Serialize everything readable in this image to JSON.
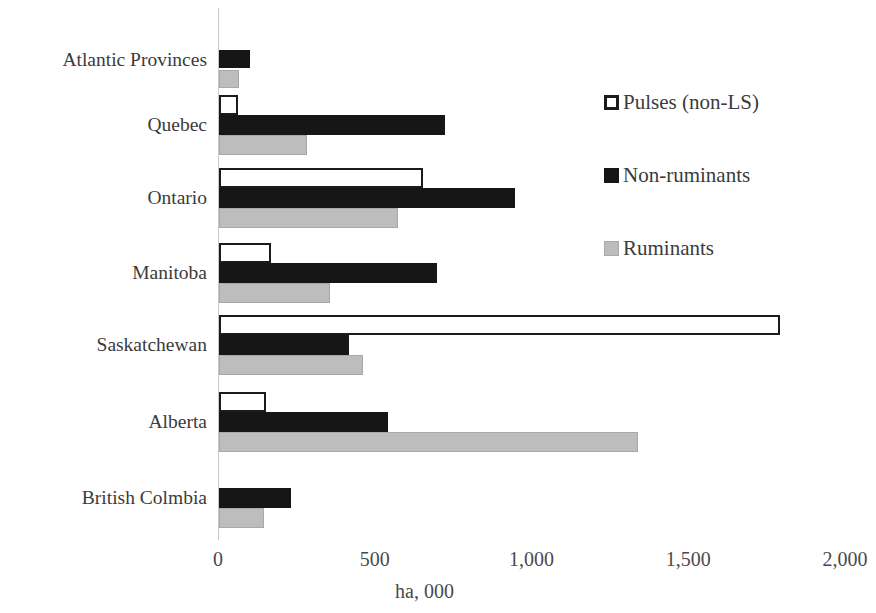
{
  "chart_data": {
    "type": "bar",
    "orientation": "horizontal",
    "title": "",
    "xlabel": "ha, 000",
    "ylabel": "",
    "xlim": [
      0,
      2000
    ],
    "xticks": [
      0,
      500,
      1000,
      1500,
      2000
    ],
    "xtick_labels": [
      "0",
      "500",
      "1,000",
      "1,500",
      "2,000"
    ],
    "grid": false,
    "legend_position": "right-top",
    "categories": [
      "Atlantic Provinces",
      "Quebec",
      "Ontario",
      "Manitoba",
      "Saskatchewan",
      "Alberta",
      "British Colmbia"
    ],
    "series": [
      {
        "name": "Pulses (non-LS)",
        "color": "#ffffff",
        "edge_color": "#1b1b1b",
        "values": [
          0,
          60,
          650,
          165,
          1790,
          150,
          0
        ]
      },
      {
        "name": "Non-ruminants",
        "color": "#161616",
        "edge_color": "#161616",
        "values": [
          100,
          720,
          945,
          695,
          415,
          540,
          230
        ]
      },
      {
        "name": "Ruminants",
        "color": "#bdbdbd",
        "edge_color": "#a8a8a8",
        "values": [
          65,
          280,
          570,
          355,
          460,
          1335,
          145
        ]
      }
    ]
  },
  "legend": {
    "items": [
      {
        "label": "Pulses (non-LS)",
        "swatch": "pulses-swatch"
      },
      {
        "label": "Non-ruminants",
        "swatch": "non-ruminants-swatch"
      },
      {
        "label": "Ruminants",
        "swatch": "ruminants-swatch"
      }
    ]
  },
  "axis": {
    "x_title": "ha, 000",
    "tick_labels": [
      "0",
      "500",
      "1,000",
      "1,500",
      "2,000"
    ]
  },
  "categories": [
    "Atlantic Provinces",
    "Quebec",
    "Ontario",
    "Manitoba",
    "Saskatchewan",
    "Alberta",
    "British Colmbia"
  ]
}
